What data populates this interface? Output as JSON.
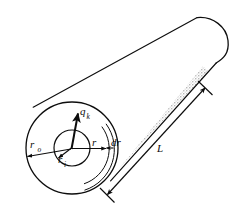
{
  "figure": {
    "type": "engineering-diagram",
    "background_color": "#ffffff",
    "line_color": "#0d0d0d",
    "shade_color": "#b9b9b9",
    "labels": {
      "outer_radius": {
        "base": "r",
        "sub": "o"
      },
      "inner_radius": {
        "base": "r",
        "sub": "i"
      },
      "radius": {
        "base": "r",
        "sub": ""
      },
      "thickness": {
        "base": "dr",
        "sub": ""
      },
      "heat_flux": {
        "base": "q",
        "sub": "k"
      },
      "length": {
        "base": "L",
        "sub": ""
      }
    },
    "geometry": {
      "outer_circle": {
        "cx": 72,
        "cy": 148,
        "r": 46
      },
      "inner_circle": {
        "cx": 72,
        "cy": 148,
        "r": 18
      },
      "element_arc_radius": 37,
      "element_arc_outer_radius": 43,
      "cylinder_axis_angle_deg": -41,
      "end_cap_rx": 17,
      "end_cap_ry": 47
    }
  }
}
